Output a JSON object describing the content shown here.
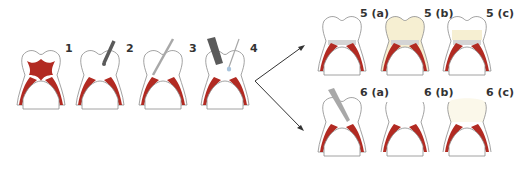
{
  "colors": {
    "pulp": "#b22a22",
    "outline": "#8a8a8a",
    "filling": "#f6efd2",
    "cement": "#d4d4d4",
    "instrument": "#5a5a5a",
    "instrument_light": "#a8a8a8",
    "arrow": "#333333"
  },
  "steps": [
    {
      "id": "1",
      "label": "1",
      "state": "full-pulp"
    },
    {
      "id": "2",
      "label": "2",
      "state": "access-opening"
    },
    {
      "id": "3",
      "label": "3",
      "state": "file-canal"
    },
    {
      "id": "4",
      "label": "4",
      "state": "irrigation"
    },
    {
      "id": "5a",
      "label": "5 (a)",
      "state": "base-layer"
    },
    {
      "id": "5b",
      "label": "5 (b)",
      "state": "full-restoration"
    },
    {
      "id": "5c",
      "label": "5 (c)",
      "state": "partial-restoration"
    },
    {
      "id": "6a",
      "label": "6 (a)",
      "state": "instrument-in-canal"
    },
    {
      "id": "6b",
      "label": "6 (b)",
      "state": "open-crown"
    },
    {
      "id": "6c",
      "label": "6 (c)",
      "state": "restored-crown"
    }
  ]
}
